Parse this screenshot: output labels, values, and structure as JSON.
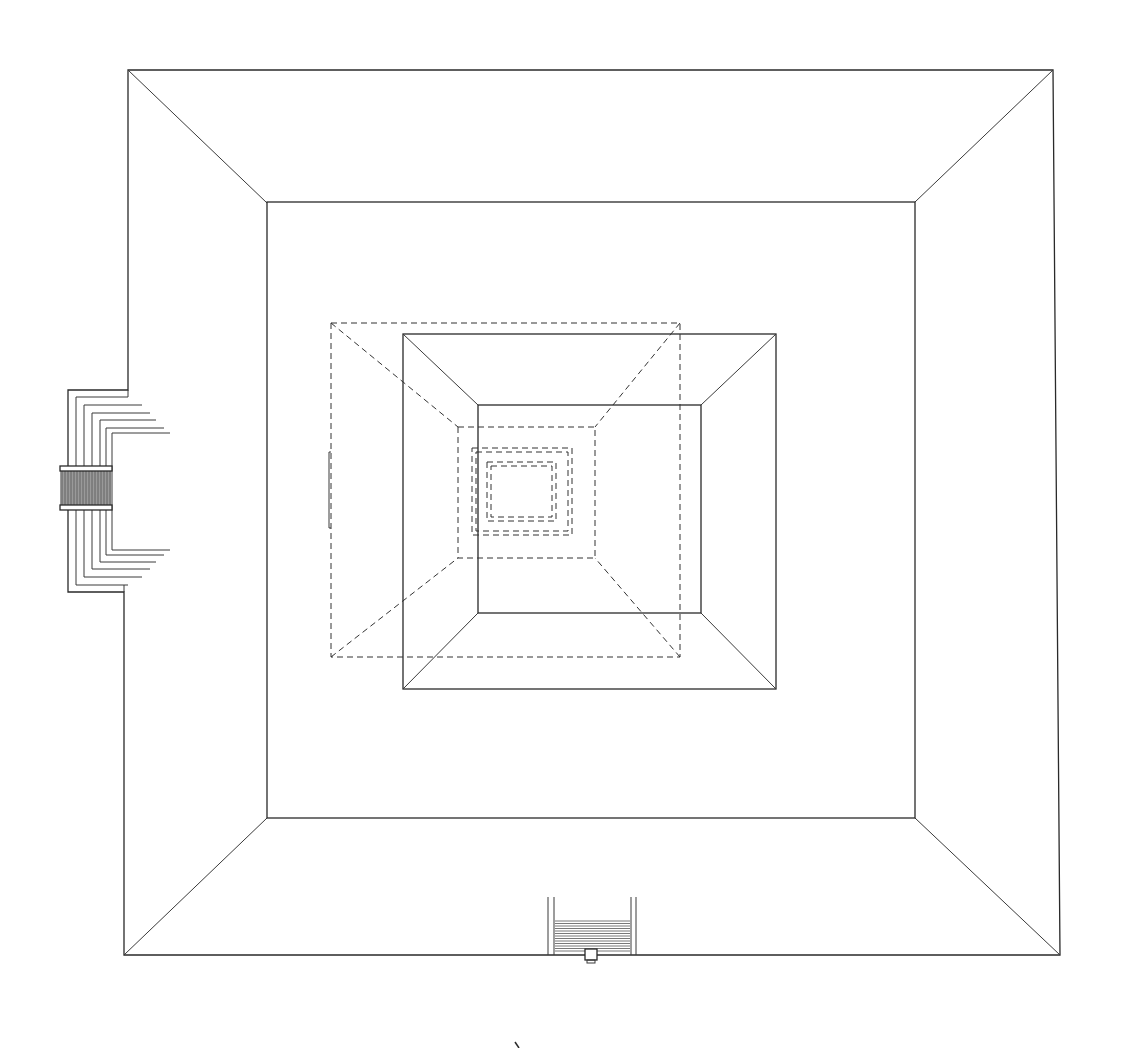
{
  "drawing": {
    "type": "architectural-plan",
    "subject": "stepped pyramid / temple platform, top view",
    "line_color": "#2a2a2a",
    "background_color": "#ffffff",
    "hatch_color": "#555555",
    "elements": [
      "outer-platform",
      "upper-terrace",
      "summit-structure",
      "earlier-structure-dashed",
      "inner-chambers-dashed",
      "west-stairway",
      "south-stairway",
      "north-arrow-mark"
    ]
  }
}
